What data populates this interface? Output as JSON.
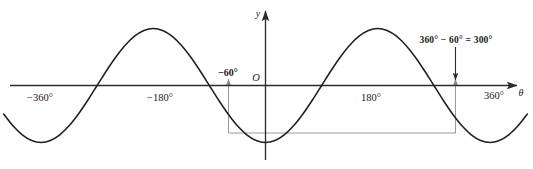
{
  "figure": {
    "background_color": "#ffffff",
    "axis_color": "#2b2b2b",
    "curve_color": "#1f1f1f",
    "guide_color": "#9a9a9a"
  },
  "axes": {
    "y_axis_label": "y",
    "x_axis_label": "θ",
    "origin_label": "O"
  },
  "ticks": {
    "x": [
      {
        "label": "−360°",
        "value": -360
      },
      {
        "label": "−180°",
        "value": -180
      },
      {
        "label": "180°",
        "value": 180
      },
      {
        "label": "360°",
        "value": 360
      }
    ]
  },
  "callouts": {
    "left_angle_label": "−60°",
    "right_annotation_label": "360° − 60° = 300°"
  },
  "chart_data": {
    "type": "line",
    "title": "",
    "subtitle": "",
    "xlabel": "θ",
    "ylabel": "y",
    "xlim": [
      -420,
      420
    ],
    "ylim": [
      -1.35,
      1.35
    ],
    "grid": false,
    "legend": null,
    "series": [
      {
        "name": "y = sin θ",
        "function": "sin",
        "amplitude": 1,
        "period": 360,
        "phase": 0,
        "x": [
          -420,
          -405,
          -390,
          -375,
          -360,
          -345,
          -330,
          -315,
          -300,
          -285,
          -270,
          -255,
          -240,
          -225,
          -210,
          -195,
          -180,
          -165,
          -150,
          -135,
          -120,
          -105,
          -90,
          -75,
          -60,
          -45,
          -30,
          -15,
          0,
          15,
          30,
          45,
          60,
          75,
          90,
          105,
          120,
          135,
          150,
          165,
          180,
          195,
          210,
          225,
          240,
          255,
          270,
          285,
          300,
          315,
          330,
          345,
          360,
          375,
          390,
          405,
          420
        ],
        "y": [
          -0.5,
          -0.707,
          -0.866,
          -0.966,
          -1,
          -0.966,
          -0.866,
          -0.707,
          -0.5,
          -0.259,
          0,
          0.259,
          0.5,
          0.707,
          0.866,
          0.966,
          1,
          0.966,
          0.866,
          0.707,
          0.5,
          0.259,
          0,
          -0.259,
          -0.5,
          -0.707,
          -0.866,
          -0.966,
          -1,
          -0.966,
          -0.866,
          -0.707,
          -0.5,
          -0.259,
          0,
          0.259,
          0.5,
          0.707,
          0.866,
          0.966,
          1,
          0.966,
          0.866,
          0.707,
          0.5,
          0.259,
          0,
          -0.259,
          -0.5,
          -0.707,
          -0.866,
          -0.966,
          -1,
          -0.966,
          -0.866,
          -0.707,
          -0.5
        ]
      }
    ],
    "x_ticks": [
      -360,
      -180,
      180,
      360
    ],
    "x_tick_labels": [
      "−360°",
      "−180°",
      "180°",
      "360°"
    ],
    "y_ticks": [],
    "annotations": [
      {
        "name": "left-angle-marker",
        "text": "−60°",
        "x": -60,
        "y": 0,
        "marker": "up-arrow-at-axis",
        "guide_to_y": -0.866
      },
      {
        "name": "right-angle-marker",
        "text": "360° − 60° = 300°",
        "x": 300,
        "y": 0,
        "marker": "down-arrow-from-above-and-up-arrow-at-axis",
        "guide_to_y": -0.866
      },
      {
        "name": "equal-value-guide",
        "text": "",
        "from_x": -60,
        "to_x": 300,
        "y": -0.866
      }
    ]
  }
}
